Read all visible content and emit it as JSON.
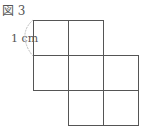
{
  "figure": {
    "label": "図 3",
    "dimension_label": "1 cm"
  },
  "grid": {
    "cell_size_px": 35,
    "origin_x": 33,
    "origin_y": 20,
    "cells": [
      {
        "row": 0,
        "col": 0
      },
      {
        "row": 0,
        "col": 1
      },
      {
        "row": 1,
        "col": 0
      },
      {
        "row": 1,
        "col": 1
      },
      {
        "row": 1,
        "col": 2
      },
      {
        "row": 2,
        "col": 1
      },
      {
        "row": 2,
        "col": 2
      }
    ],
    "line_color": "#555555",
    "brace_color": "#bbbbbb"
  }
}
